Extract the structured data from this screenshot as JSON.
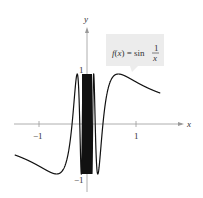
{
  "chart_data": {
    "type": "line",
    "title": "",
    "function_label": {
      "lhs": "f(x) = sin",
      "frac_num": "1",
      "frac_den": "x"
    },
    "xlabel": "x",
    "ylabel": "y",
    "x_ticks": [
      {
        "value": -1,
        "label": "−1"
      },
      {
        "value": 1,
        "label": "1"
      }
    ],
    "y_ticks": [
      {
        "value": 1,
        "label": "1"
      },
      {
        "value": -1,
        "label": "−1"
      }
    ],
    "xlim": [
      -1.5,
      1.5
    ],
    "ylim": [
      -1.3,
      1.9
    ],
    "series": [
      {
        "name": "f(x) = sin(1/x)",
        "expression": "sin(1/x)",
        "domain_excludes": [
          0
        ]
      }
    ],
    "grid": false,
    "legend": "callout box upper right"
  }
}
